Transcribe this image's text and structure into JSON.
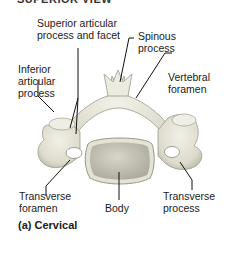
{
  "header": {
    "title": "SUPERIOR VIEW"
  },
  "labels": {
    "superior_articular": [
      "Superior articular",
      "process and facet"
    ],
    "spinous": [
      "Spinous",
      "process"
    ],
    "inferior_articular": [
      "Inferior",
      "articular",
      "process"
    ],
    "vertebral_foramen": [
      "Vertebral",
      "foramen"
    ],
    "transverse_foramen": [
      "Transverse",
      "foramen"
    ],
    "body": "Body",
    "transverse_process": [
      "Transverse",
      "process"
    ]
  },
  "caption": "(a) Cervical",
  "colors": {
    "bone": "#e6e4d6",
    "bone_shadow": "#b9b7a6",
    "body_surface": "#cfcdbf",
    "leader": "#111111"
  }
}
